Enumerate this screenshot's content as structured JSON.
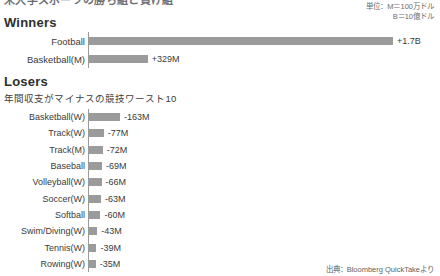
{
  "page_title_clipped": "米大学スポーツの勝ち組と負け組",
  "units_note": {
    "line1": "単位：M＝100万ドル",
    "line2": "B＝10億ドル"
  },
  "source_note": "出典：Bloomberg QuickTakeより",
  "winners": {
    "heading": "Winners",
    "subtitle": ""
  },
  "losers": {
    "heading": "Losers",
    "subtitle": "年間収支がマイナスの競技ワースト10"
  },
  "colors": {
    "bar": "#9b9b9b",
    "axis": "#9a9a9a",
    "text": "#3a3a3a",
    "heading": "#2f2f2f"
  },
  "chart_data": [
    {
      "type": "bar",
      "title": "Winners",
      "orientation": "horizontal",
      "xlabel": "",
      "ylabel": "",
      "unit": "USD",
      "grid": false,
      "legend": "none",
      "axis_origin": 0,
      "categories": [
        "Football",
        "Basketball(M)"
      ],
      "values": [
        1700,
        329
      ],
      "value_unit": "millions USD",
      "data_labels": [
        "+1.7B",
        "+329M"
      ],
      "xlim": [
        0,
        1700
      ]
    },
    {
      "type": "bar",
      "title": "Losers",
      "subtitle": "年間収支がマイナスの競技ワースト10",
      "orientation": "horizontal",
      "xlabel": "",
      "ylabel": "",
      "unit": "USD",
      "grid": false,
      "legend": "none",
      "axis_origin": 0,
      "categories": [
        "Basketball(W)",
        "Track(W)",
        "Track(M)",
        "Baseball",
        "Volleyball(W)",
        "Soccer(W)",
        "Softball",
        "Swim/Diving(W)",
        "Tennis(W)",
        "Rowing(W)"
      ],
      "values": [
        -163,
        -77,
        -72,
        -69,
        -66,
        -63,
        -60,
        -43,
        -39,
        -35
      ],
      "value_unit": "millions USD",
      "data_labels": [
        "-163M",
        "-77M",
        "-72M",
        "-69M",
        "-66M",
        "-63M",
        "-60M",
        "-43M",
        "-39M",
        "-35M"
      ],
      "xlim": [
        -163,
        0
      ]
    }
  ]
}
